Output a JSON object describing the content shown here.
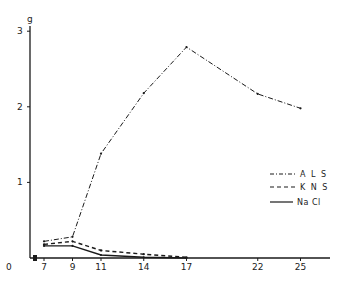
{
  "chart_data": {
    "type": "line",
    "title": "",
    "xlabel": "",
    "ylabel": "g",
    "x": [
      7,
      9,
      11,
      14,
      17,
      22,
      25
    ],
    "x_tick_labels": [
      "0",
      "7",
      "9",
      "11",
      "14",
      "17",
      "22",
      "25"
    ],
    "y_tick_labels": [
      "0",
      "1",
      "2",
      "3"
    ],
    "ylim": [
      0,
      3
    ],
    "xlim": [
      0,
      27
    ],
    "x_axis_break": true,
    "grid": false,
    "legend_position": "right-middle",
    "series": [
      {
        "name": "ALS",
        "style": "dash-dot",
        "x": [
          7,
          9,
          11,
          14,
          17,
          22,
          25
        ],
        "values": [
          0.22,
          0.28,
          1.38,
          2.18,
          2.79,
          2.17,
          1.98
        ]
      },
      {
        "name": "KNS",
        "style": "dashed",
        "x": [
          7,
          9,
          11,
          14,
          17
        ],
        "values": [
          0.18,
          0.22,
          0.1,
          0.05,
          0.01
        ]
      },
      {
        "name": "NaCl",
        "style": "solid",
        "x": [
          7,
          9,
          11,
          14,
          17
        ],
        "values": [
          0.16,
          0.16,
          0.04,
          0.01,
          0.0
        ]
      }
    ]
  },
  "legend": {
    "items": [
      {
        "label": "A L S",
        "style": "dash-dot"
      },
      {
        "label": "K N S",
        "style": "dashed"
      },
      {
        "label": "Na Cl",
        "style": "solid"
      }
    ]
  },
  "axes": {
    "y_unit": "g",
    "y_ticks": [
      {
        "label": "3",
        "value": 3
      },
      {
        "label": "2",
        "value": 2
      },
      {
        "label": "1",
        "value": 1
      }
    ],
    "zero_label": "0",
    "x_ticks": [
      {
        "label": "7",
        "value": 7
      },
      {
        "label": "9",
        "value": 9
      },
      {
        "label": "11",
        "value": 11
      },
      {
        "label": "14",
        "value": 14
      },
      {
        "label": "17",
        "value": 17
      },
      {
        "label": "22",
        "value": 22
      },
      {
        "label": "25",
        "value": 25
      }
    ]
  },
  "colors": {
    "ink": "#1a1a1a",
    "background": "#ffffff"
  }
}
